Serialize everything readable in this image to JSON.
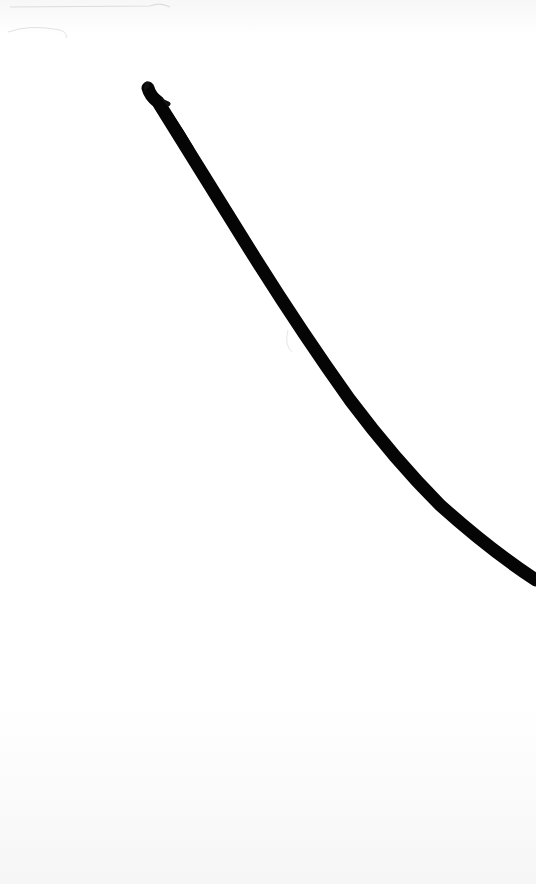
{
  "image": {
    "description": "Scanned white paper with a single thick black curved fiber/hair stroke running from upper-left to right edge",
    "colors": {
      "paper": "#ffffff",
      "paper_shadow": "#f3f3f3",
      "stroke": "#050505",
      "faint_marks": "#d8d8d8"
    }
  }
}
